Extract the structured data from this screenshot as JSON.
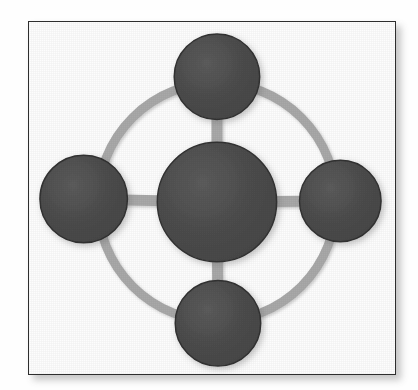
{
  "canvas": {
    "width": 418,
    "height": 390,
    "background_color": "#fefefe"
  },
  "frame": {
    "label": "image border",
    "x": 28,
    "y": 21,
    "width": 368,
    "height": 354,
    "fill_color": "#fdfdfd",
    "border_color": "#2e2e2e",
    "border_width": 1,
    "shadow_color": "rgba(70,70,70,0.30)"
  },
  "diagram": {
    "center": {
      "x": 189,
      "y": 181
    },
    "ring": {
      "label": "connector ring",
      "radius": 120,
      "stroke_color": "#a9a9a9",
      "stroke_width": 9
    },
    "spoke": {
      "label": "spoke connector",
      "stroke_color": "#a9a9a9",
      "stroke_width": 11
    },
    "node_style": {
      "fill_color": "#4d4d4d",
      "fill_color_light": "#5a5a5a",
      "fill_color_dark": "#3e3e3e",
      "rim_color": "#323232",
      "shadow_color": "rgba(90,90,90,0.35)"
    },
    "hub": {
      "id": "hub",
      "label": "central hub node",
      "cx": 189,
      "cy": 181,
      "r": 60
    },
    "satellites": [
      {
        "id": "node-top",
        "label": "top satellite node",
        "position": "top",
        "cx": 189,
        "cy": 55,
        "r": 43
      },
      {
        "id": "node-right",
        "label": "right satellite node",
        "position": "right",
        "cx": 313,
        "cy": 180,
        "r": 41
      },
      {
        "id": "node-bottom",
        "label": "bottom satellite node",
        "position": "bottom",
        "cx": 190,
        "cy": 303,
        "r": 43
      },
      {
        "id": "node-left",
        "label": "left satellite node",
        "position": "left",
        "cx": 55,
        "cy": 178,
        "r": 44
      }
    ]
  }
}
